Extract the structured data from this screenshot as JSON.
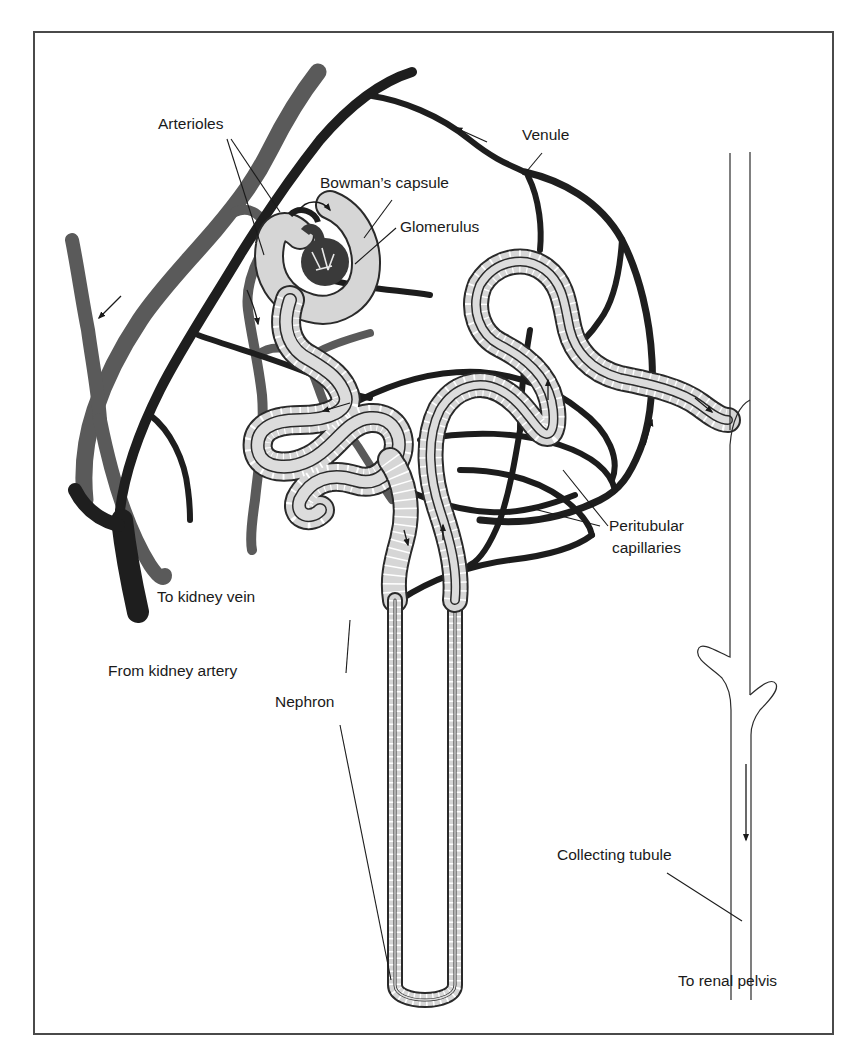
{
  "figure": {
    "frame": {
      "x": 34,
      "y": 32,
      "width": 799,
      "height": 1002,
      "color": "#4a4a4a"
    },
    "colors": {
      "vein": "#5a5a5a",
      "artery": "#1e1e1e",
      "capillary": "#1c1c1c",
      "tubule_fill": "#d6d6d6",
      "tubule_outline": "#2a2a2a",
      "text": "#1a1a1a",
      "background": "#ffffff"
    }
  },
  "labels": {
    "arterioles": "Arterioles",
    "venule": "Venule",
    "bowmans_capsule": "Bowman’s capsule",
    "glomerulus": "Glomerulus",
    "peritubular_line1": "Peritubular",
    "peritubular_line2": "capillaries",
    "to_kidney_vein": "To kidney vein",
    "from_kidney_artery": "From kidney artery",
    "nephron": "Nephron",
    "collecting_tubule": "Collecting tubule",
    "to_renal_pelvis": "To renal pelvis"
  },
  "icons": {
    "flow_arrows": [
      "venule-flow-arrow",
      "vein-flow-arrow",
      "arteriole-flow-arrow",
      "tubule-flow-arrow",
      "collecting-flow-arrow"
    ]
  }
}
